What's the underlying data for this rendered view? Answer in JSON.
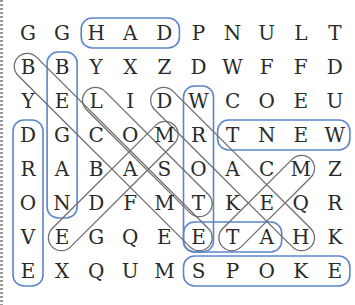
{
  "puzzle": {
    "grid": [
      [
        "G",
        "G",
        "H",
        "A",
        "D",
        "P",
        "N",
        "U",
        "L",
        "T"
      ],
      [
        "B",
        "B",
        "Y",
        "X",
        "Z",
        "D",
        "W",
        "F",
        "F",
        "D"
      ],
      [
        "Y",
        "E",
        "L",
        "I",
        "D",
        "W",
        "C",
        "O",
        "E",
        "U"
      ],
      [
        "D",
        "G",
        "C",
        "O",
        "M",
        "R",
        "T",
        "N",
        "E",
        "W"
      ],
      [
        "R",
        "A",
        "B",
        "A",
        "S",
        "O",
        "A",
        "C",
        "M",
        "Z"
      ],
      [
        "O",
        "N",
        "D",
        "F",
        "M",
        "T",
        "K",
        "E",
        "Q",
        "R"
      ],
      [
        "V",
        "E",
        "G",
        "Q",
        "E",
        "E",
        "T",
        "A",
        "H",
        "K"
      ],
      [
        "E",
        "X",
        "Q",
        "U",
        "M",
        "S",
        "P",
        "O",
        "K",
        "E"
      ]
    ],
    "found_words": [
      {
        "word": "HAD",
        "start": [
          0,
          2
        ],
        "end": [
          0,
          4
        ],
        "direction": "horizontal",
        "color": "#5b86c9"
      },
      {
        "word": "BEGAN",
        "start": [
          1,
          1
        ],
        "end": [
          5,
          1
        ],
        "direction": "vertical",
        "color": "#5b86c9"
      },
      {
        "word": "DROVE",
        "start": [
          3,
          0
        ],
        "end": [
          7,
          0
        ],
        "direction": "vertical",
        "color": "#5b86c9"
      },
      {
        "word": "WROTE",
        "start": [
          2,
          5
        ],
        "end": [
          6,
          5
        ],
        "direction": "vertical",
        "color": "#5b86c9"
      },
      {
        "word": "WENT",
        "start": [
          3,
          6
        ],
        "end": [
          3,
          9
        ],
        "direction": "horizontal",
        "color": "#5b86c9"
      },
      {
        "word": "ATE",
        "start": [
          6,
          5
        ],
        "end": [
          6,
          7
        ],
        "direction": "horizontal",
        "color": "#5b86c9"
      },
      {
        "word": "SPOKE",
        "start": [
          7,
          5
        ],
        "end": [
          7,
          9
        ],
        "direction": "horizontal",
        "color": "#5b86c9"
      },
      {
        "word": "BECAME",
        "start": [
          1,
          0
        ],
        "end": [
          6,
          5
        ],
        "direction": "diagonal",
        "color": "#6e6e6e"
      },
      {
        "word": "LOST",
        "start": [
          2,
          2
        ],
        "end": [
          5,
          5
        ],
        "direction": "diagonal",
        "color": "#6e6e6e"
      },
      {
        "word": "DRAEH",
        "start": [
          2,
          4
        ],
        "end": [
          6,
          8
        ],
        "direction": "diagonal",
        "color": "#6e6e6e"
      },
      {
        "word": "MADE",
        "start": [
          3,
          4
        ],
        "end": [
          6,
          1
        ],
        "direction": "diagonal",
        "color": "#6e6e6e"
      },
      {
        "word": "MET",
        "start": [
          4,
          8
        ],
        "end": [
          6,
          6
        ],
        "direction": "diagonal",
        "color": "#6e6e6e"
      }
    ]
  }
}
